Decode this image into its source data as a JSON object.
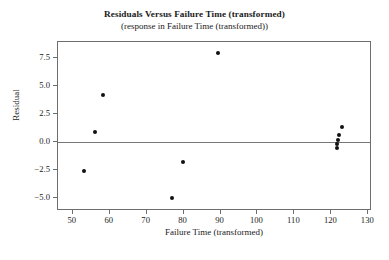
{
  "chart_data": {
    "type": "scatter",
    "title": "Residuals Versus Failure Time (transformed)",
    "subtitle": "(response in Failure Time (transformed))",
    "xlabel": "Failure Time (transformed)",
    "ylabel": "Residual",
    "xlim": [
      46,
      131
    ],
    "ylim": [
      -6.2,
      8.9
    ],
    "xticks": [
      50,
      60,
      70,
      80,
      90,
      100,
      110,
      120,
      130
    ],
    "yticks": [
      -5.0,
      -2.5,
      0.0,
      2.5,
      5.0,
      7.5
    ],
    "xticklabels": [
      "50",
      "60",
      "70",
      "80",
      "90",
      "100",
      "110",
      "120",
      "130"
    ],
    "yticklabels": [
      "-5.0",
      "-2.5",
      "0.0",
      "2.5",
      "5.0",
      "7.5"
    ],
    "grid": false,
    "legend": false,
    "reference_line": {
      "axis": "y",
      "value": 0.0,
      "color": "#777777"
    },
    "marker": {
      "shape": "circle",
      "color": "#111111",
      "size": 4
    },
    "points": [
      {
        "x": 53.0,
        "y": -2.6
      },
      {
        "x": 56.0,
        "y": 0.85
      },
      {
        "x": 58.2,
        "y": 4.2
      },
      {
        "x": 76.8,
        "y": -5.0
      },
      {
        "x": 79.8,
        "y": -1.85
      },
      {
        "x": 89.2,
        "y": 7.9
      },
      {
        "x": 121.4,
        "y": -0.55
      },
      {
        "x": 121.6,
        "y": -0.25
      },
      {
        "x": 121.8,
        "y": 0.1
      },
      {
        "x": 122.2,
        "y": 0.6
      },
      {
        "x": 123.0,
        "y": 1.3
      }
    ]
  }
}
